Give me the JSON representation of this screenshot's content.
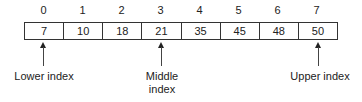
{
  "indices": [
    "0",
    "1",
    "2",
    "3",
    "4",
    "5",
    "6",
    "7"
  ],
  "values": [
    "7",
    "10",
    "18",
    "21",
    "35",
    "45",
    "48",
    "50"
  ],
  "pointers": {
    "lower": {
      "label": "Lower index",
      "position": 0
    },
    "middle": {
      "label_line1": "Middle",
      "label_line2": "index",
      "position": 3
    },
    "upper": {
      "label": "Upper index",
      "position": 7
    }
  }
}
